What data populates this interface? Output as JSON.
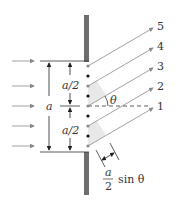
{
  "diagram": {
    "labels": {
      "half_upper": "a/2",
      "half_lower": "a/2",
      "slit_width": "a",
      "angle": "θ",
      "path_diff_num": "a",
      "path_diff_den": "2",
      "path_diff_rest": "sin θ"
    },
    "rays": [
      {
        "id": 5,
        "label": "5"
      },
      {
        "id": 4,
        "label": "4"
      },
      {
        "id": 3,
        "label": "3"
      },
      {
        "id": 2,
        "label": "2"
      },
      {
        "id": 1,
        "label": "1"
      }
    ],
    "colors": {
      "wall": "#6e6e6e",
      "ray": "#8a8a8a",
      "shade": "#e8e8e8",
      "dot_black": "#111111",
      "dot_gray": "#8a8a8a"
    }
  }
}
